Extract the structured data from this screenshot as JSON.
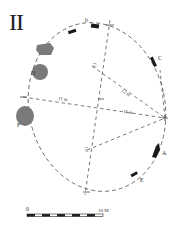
{
  "figure": {
    "title": "II",
    "type": "archaeological site plan — stone circle",
    "outline": {
      "shape": "ellipse",
      "style": "dashed"
    }
  },
  "stones": [
    {
      "id": "A",
      "label": "A",
      "style": "black-slab",
      "position": "lower-right"
    },
    {
      "id": "B",
      "label": "b",
      "style": "black-slab",
      "position": "top"
    },
    {
      "id": "C",
      "label": "C",
      "style": "black-slab",
      "position": "upper-right"
    },
    {
      "id": "D",
      "label": "D",
      "style": "grey-boulder",
      "position": "upper-left"
    },
    {
      "id": "E",
      "label": "E",
      "style": "black-slab",
      "position": "bottom-right"
    },
    {
      "id": "F",
      "label": "F",
      "style": "grey-boulder",
      "position": "left"
    },
    {
      "id": "G",
      "label": "",
      "style": "grey-boulder",
      "position": "upper-left-top"
    },
    {
      "id": "H",
      "label": "",
      "style": "black-slab",
      "position": "top-left"
    }
  ],
  "measurements": [
    {
      "label": "11 m",
      "line": "west-to-east-point"
    },
    {
      "label": "11 m",
      "line": "centre-to-east-point"
    },
    {
      "label": "12 m",
      "line": "east-point-to-north"
    },
    {
      "label": "E1",
      "line": "north-south-upper"
    },
    {
      "label": "E1",
      "line": "north-south-lower"
    }
  ],
  "scale_bar": {
    "start_label": "0",
    "end_label": "10 M",
    "segments": 10
  },
  "colors": {
    "ink": "#222222",
    "boulder": "#7a7a7a",
    "dash": "#555555"
  }
}
